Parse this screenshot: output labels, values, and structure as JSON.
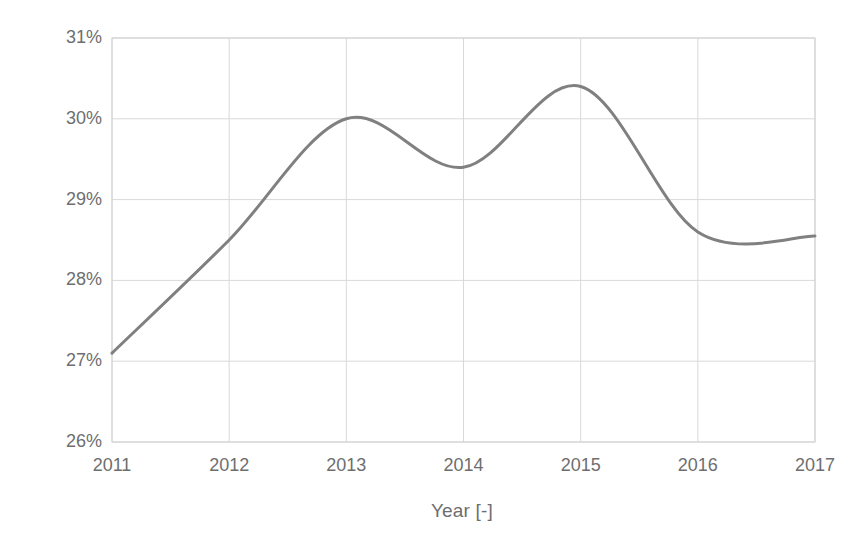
{
  "chart_data": {
    "type": "line",
    "title": "",
    "xlabel": "Year [-]",
    "ylabel": "Recycling rate [%]",
    "xlim": [
      2011,
      2017
    ],
    "ylim": [
      26,
      31
    ],
    "grid": true,
    "legend": null,
    "x_ticks": [
      "2011",
      "2012",
      "2013",
      "2014",
      "2015",
      "2016",
      "2017"
    ],
    "y_ticks": [
      "26%",
      "27%",
      "28%",
      "29%",
      "30%",
      "31%"
    ],
    "x_tick_values": [
      2011,
      2012,
      2013,
      2014,
      2015,
      2016,
      2017
    ],
    "y_tick_values": [
      26,
      27,
      28,
      29,
      30,
      31
    ],
    "series": [
      {
        "name": "Recycling rate",
        "color": "#808080",
        "line_width": 3,
        "smoothed": true,
        "x": [
          2011,
          2012,
          2013,
          2014,
          2015,
          2016,
          2017
        ],
        "values": [
          27.1,
          28.5,
          30.0,
          29.4,
          30.4,
          28.6,
          28.55
        ]
      }
    ],
    "annotations": []
  },
  "axes": {
    "x_title": "Year [-]",
    "y_title": "Recycling rate [%]"
  },
  "style": {
    "line_color": "#808080",
    "grid_color": "#d9d9d9",
    "axis_color": "#d0d0d0",
    "tick_text_color": "#6e6e6e",
    "background": "#ffffff"
  }
}
